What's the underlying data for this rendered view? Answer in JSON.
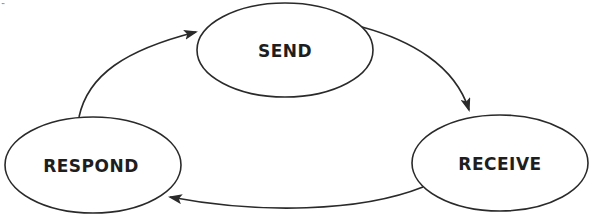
{
  "diagram": {
    "type": "cycle",
    "stroke_color": "#2a2a2a",
    "text_color": "#1e1e1e",
    "background": "#ffffff",
    "nodes": [
      {
        "id": "send",
        "label": "SEND",
        "cx": 285,
        "cy": 50,
        "rx": 88,
        "ry": 47
      },
      {
        "id": "receive",
        "label": "RECEIVE",
        "cx": 500,
        "cy": 163,
        "rx": 88,
        "ry": 48
      },
      {
        "id": "respond",
        "label": "RESPOND",
        "cx": 93,
        "cy": 165,
        "rx": 88,
        "ry": 48
      }
    ],
    "edges": [
      {
        "from": "send",
        "to": "receive",
        "direction": "clockwise"
      },
      {
        "from": "receive",
        "to": "respond",
        "direction": "clockwise"
      },
      {
        "from": "respond",
        "to": "send",
        "direction": "clockwise"
      }
    ],
    "corner_mark": "··"
  }
}
